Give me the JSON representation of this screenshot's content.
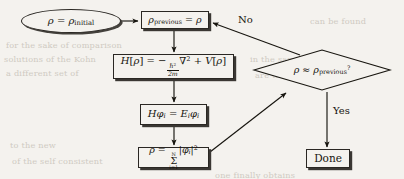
{
  "figure": {
    "kind": "flowchart",
    "background_color": "#f4f2ee",
    "ink_color": "#17150f"
  },
  "nodes": {
    "start": {
      "shape": "ellipse",
      "text": "ρ = ρinitial",
      "rho": "ρ",
      "equals": "=",
      "rho_sub": "initial"
    },
    "assign_previous": {
      "shape": "rectangle",
      "text": "ρprevious = ρ",
      "rho": "ρ",
      "sub": "previous",
      "equals": "=",
      "rhs": "ρ"
    },
    "hamiltonian": {
      "shape": "rectangle",
      "text": "H [ρ] = − ℏ²/2m ∇² + V [ρ]",
      "h": "H",
      "bracket_open": "[",
      "rho": "ρ",
      "bracket_close": "]",
      "equals": "=",
      "minus": "−",
      "numerator": "ℏ",
      "numerator_power": "2",
      "denominator": "2m",
      "nabla": "∇",
      "nabla_power": "2",
      "plus": "+",
      "v": "V"
    },
    "eigen": {
      "shape": "rectangle",
      "text": "Hφi = Eiφi",
      "h": "H",
      "phi": "φ",
      "i": "i",
      "equals": "=",
      "e": "E"
    },
    "density": {
      "shape": "rectangle",
      "text": "ρ = Σi=1N |φi|²",
      "rho": "ρ",
      "equals": "=",
      "sum": "Σ",
      "lower": "i=1",
      "upper": "N",
      "bar": "|",
      "phi": "φ",
      "i": "i",
      "power": "2"
    },
    "decision": {
      "shape": "diamond",
      "text": "ρ ≈ ρprevious?",
      "rho": "ρ",
      "approx": "≈",
      "sub": "previous",
      "question": "?"
    },
    "done": {
      "shape": "rectangle",
      "text": "Done"
    }
  },
  "edge_labels": {
    "no": "No",
    "yes": "Yes"
  },
  "background_text": [
    "can be found",
    "for the sake of comparison",
    "solutions of the Kohn",
    "a different set of",
    "in the same",
    "are then",
    "to the new",
    "of the self consistent",
    "one finally obtains"
  ]
}
